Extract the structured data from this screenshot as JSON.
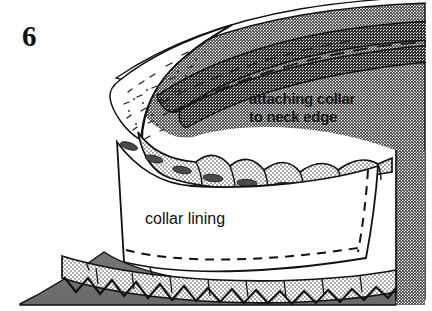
{
  "figure": {
    "number": "6",
    "kind": "sewing-instruction-illustration"
  },
  "labels": {
    "top_callout_line1": "attaching collar",
    "top_callout_line2": "to neck edge",
    "lining_label": "collar lining"
  },
  "colors": {
    "ink": "#111111",
    "paper": "#ffffff",
    "garment_gray": "#6e6e6e",
    "neckband_dark": "#5a5a5a",
    "halftone_gray": "#8a8a8a",
    "stipple_light": "#d8d8d8",
    "stitch_dark": "#3a3a3a"
  },
  "regions": {
    "garment_body": "dark gray halftone garment area filling upper right and lower left",
    "neckband": "darker gray curved neckline band sweeping from left to right",
    "collar_outer": "white speckled band along the collar fold at upper left",
    "gathered_ruffle_top": "stippled gathered lace/ruffle with dark stitch ovals under the neckband",
    "collar_lining_panel": "white panel with dashed stitching line at right and bottom",
    "gathered_ruffle_bottom": "stippled ruffle with zigzag scalloped edge along the lower border"
  }
}
